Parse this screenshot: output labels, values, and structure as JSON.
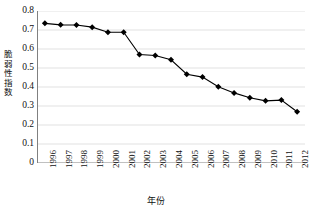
{
  "chart_data": {
    "type": "line",
    "title": "",
    "xlabel": "年份",
    "ylabel": "脆弱性指数",
    "xlim": [
      1995.5,
      2012.5
    ],
    "ylim": [
      0,
      0.8
    ],
    "grid": true,
    "legend": "none",
    "marker": "diamond",
    "marker_color": "#000000",
    "line_color": "#000000",
    "gridline_color": "#d9d9d9",
    "axis_color": "#808080",
    "categories": [
      1996,
      1997,
      1998,
      1999,
      2000,
      2001,
      2002,
      2003,
      2004,
      2005,
      2006,
      2007,
      2008,
      2009,
      2010,
      2011,
      2012
    ],
    "x_tick_labels": [
      "1996",
      "1997",
      "1998",
      "1999",
      "2000",
      "2001",
      "2002",
      "2003",
      "2004",
      "2005",
      "2006",
      "2007",
      "2008",
      "2009",
      "2010",
      "2011",
      "2012"
    ],
    "y_ticks": [
      0,
      0.1,
      0.2,
      0.3,
      0.4,
      0.5,
      0.6,
      0.7,
      0.8
    ],
    "y_tick_labels": [
      "0",
      "0.1",
      "0.2",
      "0.3",
      "0.4",
      "0.5",
      "0.6",
      "0.7",
      "0.8"
    ],
    "series": [
      {
        "name": "脆弱性指数",
        "values": [
          0.735,
          0.727,
          0.726,
          0.715,
          0.688,
          0.688,
          0.571,
          0.566,
          0.543,
          0.467,
          0.452,
          0.401,
          0.369,
          0.343,
          0.327,
          0.331,
          0.27
        ]
      }
    ]
  }
}
